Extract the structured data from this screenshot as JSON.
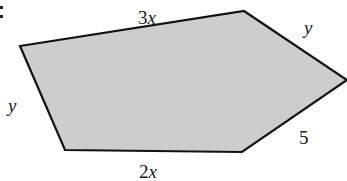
{
  "figure": {
    "shape": "pentagon",
    "fill_color": "#cdcdcd",
    "stroke_color": "#111111",
    "vertices": [
      [
        20,
        46
      ],
      [
        244,
        11
      ],
      [
        347,
        80
      ],
      [
        242,
        152
      ],
      [
        65,
        150
      ]
    ],
    "sides": [
      {
        "label": "3x",
        "coef": "3",
        "var": "x"
      },
      {
        "label": "y",
        "coef": "",
        "var": "y"
      },
      {
        "label": "5",
        "coef": "5",
        "var": ""
      },
      {
        "label": "2x",
        "coef": "2",
        "var": "x"
      },
      {
        "label": "y",
        "coef": "",
        "var": "y"
      }
    ]
  }
}
